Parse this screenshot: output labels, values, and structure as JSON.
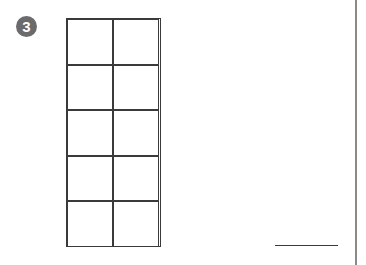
{
  "problem": {
    "number": "3",
    "badge_color": "#6b6b6b",
    "ten_frame": {
      "rows": 5,
      "columns": 2,
      "filled_cells": 0
    },
    "answer": ""
  }
}
